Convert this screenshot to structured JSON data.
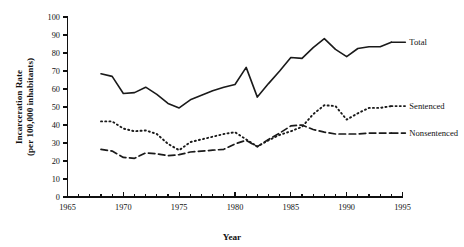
{
  "chart_data": {
    "type": "line",
    "title": "",
    "xlabel": "Year",
    "ylabel": "Incarceration Rate (per 100,000 inhabitants)",
    "ylabel_line1": "Incarceration Rate",
    "ylabel_line2": "(per 100,000 inhabitants)",
    "xlim": [
      1965,
      1995
    ],
    "ylim": [
      0,
      100
    ],
    "grid": false,
    "legend_position": "inline-right-end",
    "x_major_ticks": [
      1965,
      1970,
      1975,
      1980,
      1985,
      1990,
      1995
    ],
    "x_major_tick_labels": [
      "1965",
      "1970",
      "1975",
      "1980",
      "1985",
      "1990",
      "1995"
    ],
    "x_minor_tick_interval": 1,
    "y_ticks": [
      0,
      10,
      20,
      30,
      40,
      50,
      60,
      70,
      80,
      90,
      100
    ],
    "y_tick_labels": [
      "0",
      "10",
      "20",
      "30",
      "40",
      "50",
      "60",
      "70",
      "80",
      "90",
      "100"
    ],
    "x": [
      1968,
      1969,
      1970,
      1971,
      1972,
      1973,
      1974,
      1975,
      1976,
      1977,
      1978,
      1979,
      1980,
      1981,
      1982,
      1983,
      1984,
      1985,
      1986,
      1987,
      1988,
      1989,
      1990,
      1991,
      1992,
      1993,
      1994
    ],
    "series": [
      {
        "name": "Total",
        "label": "Total",
        "style": "solid",
        "values": [
          68.5,
          67.0,
          57.5,
          58.0,
          61.0,
          57.0,
          52.0,
          49.5,
          54.0,
          56.5,
          59.0,
          61.0,
          62.5,
          72.0,
          55.5,
          63.0,
          70.0,
          77.5,
          77.0,
          83.0,
          88.0,
          82.0,
          78.0,
          82.5,
          83.5,
          83.5,
          86.0
        ]
      },
      {
        "name": "Sentenced",
        "label": "Sentenced",
        "style": "dotted",
        "values": [
          42.0,
          42.0,
          38.0,
          36.5,
          37.0,
          35.0,
          29.5,
          26.0,
          30.5,
          32.0,
          33.5,
          35.0,
          36.0,
          32.0,
          28.0,
          31.5,
          34.5,
          36.5,
          39.0,
          46.0,
          51.0,
          50.5,
          43.0,
          46.5,
          49.5,
          49.5,
          50.5
        ]
      },
      {
        "name": "Nonsentenced",
        "label": "Nonsentenced",
        "style": "dashed",
        "values": [
          26.5,
          25.5,
          22.0,
          21.5,
          24.5,
          24.0,
          23.0,
          23.5,
          25.0,
          25.5,
          26.0,
          26.5,
          29.5,
          31.5,
          28.0,
          32.0,
          35.5,
          39.5,
          40.0,
          37.5,
          36.0,
          35.0,
          35.0,
          35.0,
          35.5,
          35.5,
          35.5
        ]
      }
    ]
  }
}
